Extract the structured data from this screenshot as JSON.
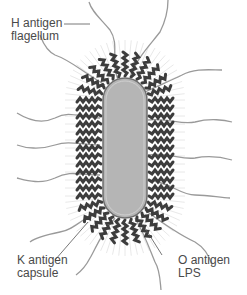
{
  "diagram": {
    "labels": {
      "h_antigen": {
        "line1": "H antigen",
        "line2": "flagellum"
      },
      "k_antigen": {
        "line1": "K antigen",
        "line2": "capsule"
      },
      "o_antigen": {
        "line1": "O antigen",
        "line2": "LPS"
      }
    },
    "colors": {
      "cell_body": "#b3b3b3",
      "cell_outline": "#6e6e6e",
      "o_antigen_chains": "#3c3c3c",
      "flagella": "#9a9a9a",
      "capsule_rays": "#dddddd",
      "leader_lines": "#555555",
      "text": "#4a4a4a"
    }
  }
}
